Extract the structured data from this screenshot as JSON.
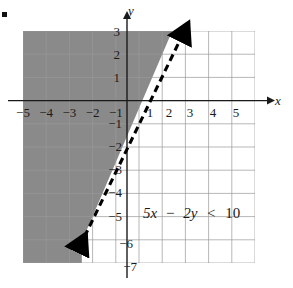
{
  "figure": {
    "kind": "linear-inequality-graph",
    "bullet_marker": "▪",
    "colors": {
      "shading": "#8a8a8a",
      "grid": "#9a9a9a",
      "axis": "#1a1a1a",
      "boundary_line": "#000000",
      "background": "#ffffff"
    },
    "axes": {
      "x_label": "x",
      "y_label": "y",
      "x_min": -5,
      "x_max": 5,
      "y_min": -7,
      "y_max": 3,
      "x_ticks": [
        "−5",
        "−4",
        "−3",
        "−2",
        "−1",
        "1",
        "2",
        "3",
        "4",
        "5"
      ],
      "y_ticks": [
        "3",
        "2",
        "1",
        "−1",
        "−2",
        "−3",
        "−4",
        "−5",
        "−6",
        "−7"
      ],
      "grid": "on",
      "grid_step": 1
    },
    "inequality": {
      "full_text": "5x − 2y < 10",
      "lhs_coef_x": "5x",
      "minus": "−",
      "lhs_coef_y": "2y",
      "relation": "<",
      "rhs": "10"
    },
    "boundary": {
      "style": "dashed",
      "equation": "5x − 2y = 10",
      "slope": 2.5,
      "y_intercept": -5,
      "x_intercept": 2,
      "arrow_start": true,
      "arrow_end": true
    },
    "shaded_region": {
      "side": "left-of-line",
      "description": "5x − 2y < 10",
      "pattern": "solid-gray-stipple"
    }
  }
}
